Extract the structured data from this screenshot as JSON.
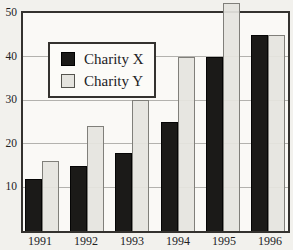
{
  "chart_data": {
    "type": "bar",
    "title": "",
    "categories": [
      "1991",
      "1992",
      "1993",
      "1994",
      "1995",
      "1996"
    ],
    "series": [
      {
        "name": "Charity X",
        "color": "#1b1a18",
        "values": [
          12,
          15,
          18,
          25,
          40,
          45
        ]
      },
      {
        "name": "Charity Y",
        "color": "#e5e4df",
        "values": [
          16,
          24,
          30,
          40,
          50,
          45
        ]
      }
    ],
    "xlabel": "",
    "ylabel": "",
    "ylim": [
      0,
      50
    ],
    "yticks": [
      10,
      20,
      30,
      40,
      50
    ],
    "grid": true,
    "legend_position": "upper-left-inside",
    "overflow_note": "1995 Charity Y bar extends slightly above the 50 frame line"
  },
  "colors": {
    "background": "#f2f1ed",
    "plot_background": "#faf9f6",
    "frame": "#34322f",
    "gridline": "#b3b2ae",
    "text": "#22211f",
    "legend_background": "#fcfbf8",
    "bar_charity_x": "#1b1a18",
    "bar_charity_y": "#e5e4df",
    "bar_charity_y_border": "#807f7a"
  }
}
